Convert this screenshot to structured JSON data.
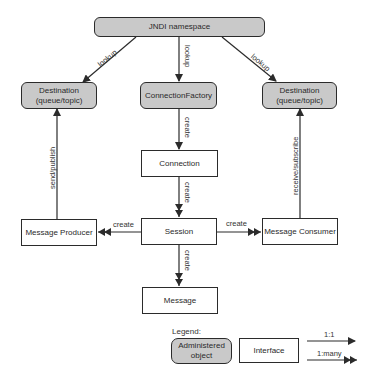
{
  "nodes": {
    "jndi": {
      "label": "JNDI namespace",
      "type": "administered"
    },
    "dest_left": {
      "line1": "Destination",
      "line2": "(queue/topic)",
      "type": "administered"
    },
    "connection_factory": {
      "label": "ConnectionFactory",
      "type": "administered"
    },
    "dest_right": {
      "line1": "Destination",
      "line2": "(queue/topic)",
      "type": "administered"
    },
    "connection": {
      "label": "Connection",
      "type": "interface"
    },
    "session": {
      "label": "Session",
      "type": "interface"
    },
    "producer": {
      "label": "Message Producer",
      "type": "interface"
    },
    "consumer": {
      "label": "Message Consumer",
      "type": "interface"
    },
    "message": {
      "label": "Message",
      "type": "interface"
    }
  },
  "edges": {
    "lookup_left": "lookup",
    "lookup_center": "lookup",
    "lookup_right": "lookup",
    "cf_to_connection": "create",
    "connection_to_session": "create",
    "session_to_producer": "create",
    "session_to_consumer": "create",
    "session_to_message": "create",
    "producer_to_dest": "send/publish",
    "consumer_to_dest": "receive/subscribe"
  },
  "legend": {
    "title": "Legend:",
    "administered_line1": "Administered",
    "administered_line2": "object",
    "interface": "Interface",
    "one_to_one": "1:1",
    "one_to_many": "1:many"
  },
  "colors": {
    "administered_fill": "#c9c9c9",
    "interface_fill": "#ffffff",
    "stroke": "#2b2b2b"
  }
}
